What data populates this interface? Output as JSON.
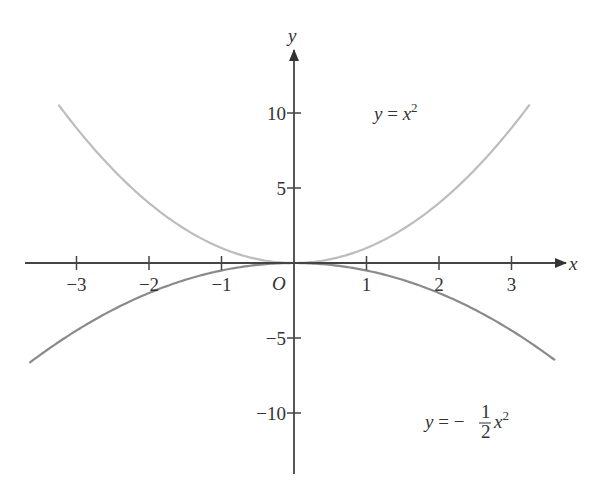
{
  "chart_data": {
    "type": "line",
    "title": "",
    "xlabel": "x",
    "ylabel": "y",
    "origin_label": "O",
    "xlim": [
      -3.7,
      3.7
    ],
    "ylim": [
      -14,
      16
    ],
    "x_ticks": [
      -3,
      -2,
      -1,
      1,
      2,
      3
    ],
    "x_tick_labels": [
      "−3",
      "−2",
      "−1",
      "1",
      "2",
      "3"
    ],
    "y_ticks": [
      10,
      5,
      -5,
      -10
    ],
    "y_tick_labels": [
      "10",
      "5",
      "−5",
      "−10"
    ],
    "grid": false,
    "series": [
      {
        "name": "y = x^2",
        "label_parts": {
          "lhs": "y",
          "eq": " = ",
          "rhs": "x",
          "sup": "2"
        },
        "color": "#bdbdbd",
        "x_range": [
          -3.25,
          3.25
        ],
        "x": [
          -3.25,
          -3,
          -2,
          -1,
          0,
          1,
          2,
          3,
          3.25
        ],
        "y": [
          10.56,
          9,
          4,
          1,
          0,
          1,
          4,
          9,
          10.56
        ]
      },
      {
        "name": "y = -1/2 x^2",
        "label_parts": {
          "lhs": "y",
          "eq": " = −",
          "num": "1",
          "den": "2",
          "rhs": "x",
          "sup": "2"
        },
        "color": "#8a8a8a",
        "x_range": [
          -3.65,
          3.6
        ],
        "x": [
          -3.65,
          -3,
          -2,
          -1,
          0,
          1,
          2,
          3,
          3.6
        ],
        "y": [
          -6.66,
          -4.5,
          -2,
          -0.5,
          0,
          -0.5,
          -2,
          -4.5,
          -6.48
        ]
      }
    ]
  }
}
